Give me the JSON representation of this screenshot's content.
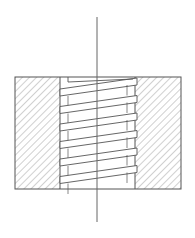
{
  "diagram": {
    "type": "threaded-hole-section",
    "colors": {
      "line": "#555555",
      "hatch": "#8a8a8a",
      "background": "#ffffff",
      "centerline": "#666666"
    },
    "body": {
      "x": 15,
      "y": 77,
      "width": 166,
      "height": 112
    },
    "bore": {
      "left_root": 60,
      "left_crest": 68,
      "right_crest": 127,
      "right_root": 135
    },
    "centerline": {
      "x": 97,
      "y1": 17,
      "y2": 222
    },
    "thread": {
      "pitch": 17.5,
      "turns": 6,
      "start_y": 82,
      "slope": -5
    },
    "hatch_spacing": 5
  }
}
